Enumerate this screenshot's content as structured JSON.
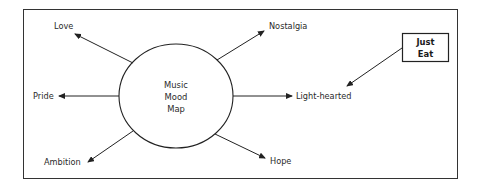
{
  "diagram": {
    "center": {
      "lines": [
        "Music",
        "Mood",
        "Map"
      ]
    },
    "moods": [
      {
        "id": "love",
        "label": "Love"
      },
      {
        "id": "nostalgia",
        "label": "Nostalgia"
      },
      {
        "id": "pride",
        "label": "Pride"
      },
      {
        "id": "light-hearted",
        "label": "Light-hearted"
      },
      {
        "id": "ambition",
        "label": "Ambition"
      },
      {
        "id": "hope",
        "label": "Hope"
      }
    ],
    "brand_box": {
      "lines": [
        "Just",
        "Eat"
      ],
      "points_to": "Light-hearted"
    },
    "colors": {
      "stroke": "#222222",
      "text": "#2a2a2a",
      "background": "#ffffff"
    }
  }
}
